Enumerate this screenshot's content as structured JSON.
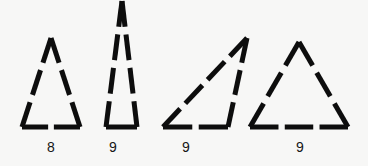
{
  "figure": {
    "background_color": "#f7f7f6",
    "stroke_color": "#0d0d0d",
    "width": 368,
    "height": 166
  },
  "shapes": [
    {
      "id": "triangle-1",
      "name": "narrow-isosceles-triangle",
      "label": "8",
      "segment_count": 8,
      "apex": [
        51,
        38
      ],
      "base_left": [
        22,
        127
      ],
      "base_right": [
        80,
        127
      ],
      "dashes": {
        "left_side": 3,
        "right_side": 3,
        "base": 2
      },
      "stroke_width": 5
    },
    {
      "id": "triangle-2",
      "name": "tall-sliver-triangle",
      "label": "9",
      "segment_count": 9,
      "apex": [
        122,
        1
      ],
      "base_left": [
        106,
        127
      ],
      "base_right": [
        137,
        127
      ],
      "dashes": {
        "left_side": 4,
        "right_side": 4,
        "base": 1
      },
      "stroke_width": 5
    },
    {
      "id": "triangle-3",
      "name": "oblique-scalene-triangle",
      "label": "9",
      "segment_count": 9,
      "apex": [
        247,
        38
      ],
      "base_left": [
        163,
        127
      ],
      "base_right": [
        228,
        127
      ],
      "dashes": {
        "left_side": 4,
        "right_side": 3,
        "base": 2
      },
      "stroke_width": 5
    },
    {
      "id": "triangle-4",
      "name": "wide-isosceles-triangle",
      "label": "9",
      "segment_count": 9,
      "apex": [
        299,
        42
      ],
      "base_left": [
        250,
        127
      ],
      "base_right": [
        348,
        127
      ],
      "dashes": {
        "left_side": 3,
        "right_side": 3,
        "base": 3
      },
      "stroke_width": 5
    }
  ],
  "labels": {
    "shape_1": "8",
    "shape_2": "9",
    "shape_3": "9",
    "shape_4": "9"
  }
}
